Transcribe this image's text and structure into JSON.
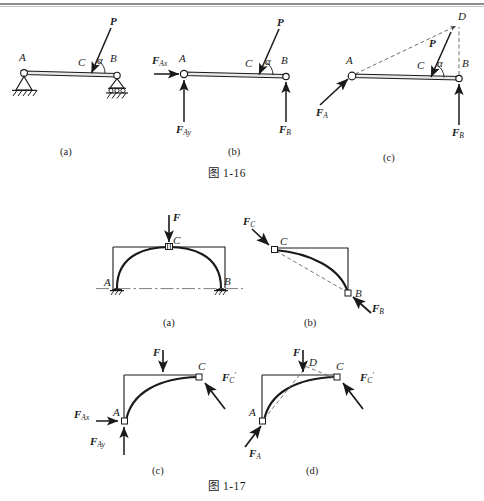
{
  "page": {
    "background": "#ffffff",
    "ink": "#1a1a1a"
  },
  "figure_1_16": {
    "caption": "图 1-16",
    "subfigures": [
      {
        "key": "a",
        "label": "(a)",
        "title": "梁的简图"
      },
      {
        "key": "b",
        "label": "(b)",
        "title": "受力图（正交分量）"
      },
      {
        "key": "c",
        "label": "(c)",
        "title": "三力汇交"
      }
    ],
    "a": {
      "points": {
        "A": "A",
        "B": "B",
        "C": "C"
      },
      "force_P": "P",
      "angle": "α",
      "support_A": "pin-support",
      "support_B": "roller-support"
    },
    "b": {
      "points": {
        "A": "A",
        "B": "B",
        "C": "C"
      },
      "force_P": "P",
      "angle": "α",
      "reaction_Ax": {
        "base": "F",
        "sub": "Ax"
      },
      "reaction_Ay": {
        "base": "F",
        "sub": "Ay"
      },
      "reaction_B": {
        "base": "F",
        "sub": "B"
      }
    },
    "c": {
      "points": {
        "A": "A",
        "B": "B",
        "C": "C",
        "D": "D"
      },
      "force_P": "P",
      "angle": "α",
      "reaction_A": {
        "base": "F",
        "sub": "A"
      },
      "reaction_B": {
        "base": "F",
        "sub": "B"
      }
    }
  },
  "figure_1_17": {
    "caption": "图 1-17",
    "subfigures": [
      {
        "key": "a",
        "label": "(a)",
        "title": "三铰拱整体"
      },
      {
        "key": "b",
        "label": "(b)",
        "title": "BC 二力构件"
      },
      {
        "key": "c",
        "label": "(c)",
        "title": "AC 受力图"
      },
      {
        "key": "d",
        "label": "(d)",
        "title": "AC 三力汇交"
      }
    ],
    "a": {
      "points": {
        "A": "A",
        "B": "B",
        "C": "C"
      },
      "force_F": "F",
      "support_A": "pin-support",
      "support_B": "pin-support",
      "hinge_C": "hinge"
    },
    "b": {
      "points": {
        "B": "B",
        "C": "C"
      },
      "force_Cprime": {
        "base": "F",
        "sub": "C"
      },
      "force_B": {
        "base": "F",
        "sub": "B"
      }
    },
    "c": {
      "points": {
        "A": "A",
        "C": "C"
      },
      "force_F": "F",
      "force_Cprime": {
        "base": "F",
        "sub": "C",
        "prime": "′"
      },
      "reaction_Ax": {
        "base": "F",
        "sub": "Ax"
      },
      "reaction_Ay": {
        "base": "F",
        "sub": "Ay"
      }
    },
    "d": {
      "points": {
        "A": "A",
        "C": "C",
        "D": "D"
      },
      "force_F": "F",
      "force_Cprime": {
        "base": "F",
        "sub": "C",
        "prime": "′"
      },
      "reaction_A": {
        "base": "F",
        "sub": "A"
      }
    }
  }
}
